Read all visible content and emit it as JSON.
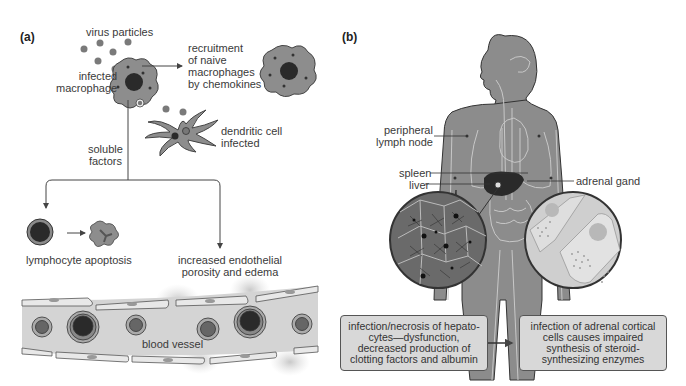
{
  "panel_a": {
    "label": "(a)",
    "virus_particles": "virus particles",
    "infected_macrophage": [
      "infected",
      "macrophage"
    ],
    "recruitment": [
      "recruitment",
      "of naive",
      "macrophages",
      "by chemokines"
    ],
    "dendritic_cell": [
      "dendritic cell",
      "infected"
    ],
    "soluble_factors": [
      "soluble",
      "factors"
    ],
    "lymphocyte_apoptosis": "lymphocyte apoptosis",
    "endothelial": [
      "increased endothelial",
      "porosity and edema"
    ],
    "blood_vessel": "blood vessel"
  },
  "panel_b": {
    "label": "(b)",
    "peripheral_lymph_node": [
      "peripheral",
      "lymph node"
    ],
    "spleen": "spleen",
    "liver": "liver",
    "adrenal_gland": "adrenal gand",
    "liver_box": "infection/necrosis of hepato-cytes—dysfunction, decreased production of clotting factors and albumin",
    "adrenal_box": "infection of adrenal cortical cells causes impaired synthesis of steroid-synthesizing enzymes"
  },
  "colors": {
    "cell_gray": "#8a8a8a",
    "nucleus": "#2a2a2a",
    "body_gray": "#8c8c8c",
    "vessel_fill": "#d4d4d4",
    "box_fill": "#d8d8d8"
  }
}
